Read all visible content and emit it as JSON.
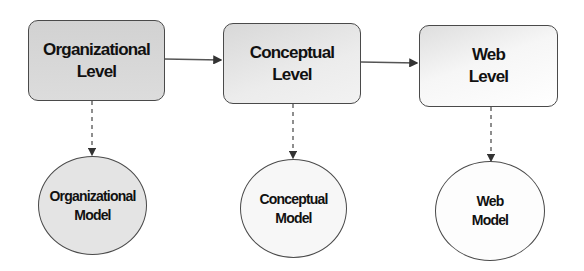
{
  "diagram": {
    "levels": [
      {
        "line1": "Organizational",
        "line2": "Level"
      },
      {
        "line1": "Conceptual",
        "line2": "Level"
      },
      {
        "line1": "Web",
        "line2": "Level"
      }
    ],
    "models": [
      {
        "line1": "Organizational",
        "line2": "Model"
      },
      {
        "line1": "Conceptual",
        "line2": "Model"
      },
      {
        "line1": "Web",
        "line2": "Model"
      }
    ],
    "edges": [
      {
        "from": "Organizational Level",
        "to": "Conceptual Level",
        "style": "solid"
      },
      {
        "from": "Conceptual Level",
        "to": "Web Level",
        "style": "solid"
      },
      {
        "from": "Organizational Level",
        "to": "Organizational Model",
        "style": "dashed"
      },
      {
        "from": "Conceptual Level",
        "to": "Conceptual Model",
        "style": "dashed"
      },
      {
        "from": "Web Level",
        "to": "Web Model",
        "style": "dashed"
      }
    ],
    "colors": {
      "stroke": "#4a4a4a",
      "text": "#111111",
      "fill_dark": "#d6d6d6",
      "fill_light": "#f6f6f6"
    }
  }
}
